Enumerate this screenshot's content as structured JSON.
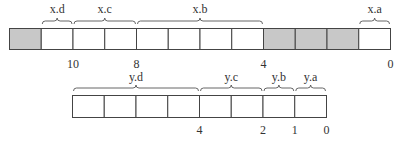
{
  "colors": {
    "shaded": "#c8c8c8",
    "empty": "#ffffff",
    "stroke": "#444444"
  },
  "register_x": {
    "cells": [
      {
        "shaded": true
      },
      {
        "shaded": false
      },
      {
        "shaded": false
      },
      {
        "shaded": false
      },
      {
        "shaded": false
      },
      {
        "shaded": false
      },
      {
        "shaded": false
      },
      {
        "shaded": false
      },
      {
        "shaded": true
      },
      {
        "shaded": true
      },
      {
        "shaded": true
      },
      {
        "shaded": false
      }
    ],
    "fields": [
      {
        "label": "x.d",
        "from": 1,
        "to": 2
      },
      {
        "label": "x.c",
        "from": 2,
        "to": 4
      },
      {
        "label": "x.b",
        "from": 4,
        "to": 8
      },
      {
        "label": "x.a",
        "from": 11,
        "to": 12
      }
    ],
    "ticks": [
      {
        "label": "10",
        "at": 2
      },
      {
        "label": "8",
        "at": 4
      },
      {
        "label": "4",
        "at": 8
      },
      {
        "label": "0",
        "at": 12
      }
    ]
  },
  "register_y": {
    "cells": [
      {
        "shaded": false
      },
      {
        "shaded": false
      },
      {
        "shaded": false
      },
      {
        "shaded": false
      },
      {
        "shaded": false
      },
      {
        "shaded": false
      },
      {
        "shaded": false
      },
      {
        "shaded": false
      }
    ],
    "fields": [
      {
        "label": "y.d",
        "from": 0,
        "to": 4
      },
      {
        "label": "y.c",
        "from": 4,
        "to": 6
      },
      {
        "label": "y.b",
        "from": 6,
        "to": 7
      },
      {
        "label": "y.a",
        "from": 7,
        "to": 8
      }
    ],
    "ticks": [
      {
        "label": "4",
        "at": 4
      },
      {
        "label": "2",
        "at": 6
      },
      {
        "label": "1",
        "at": 7
      },
      {
        "label": "0",
        "at": 8
      }
    ]
  }
}
